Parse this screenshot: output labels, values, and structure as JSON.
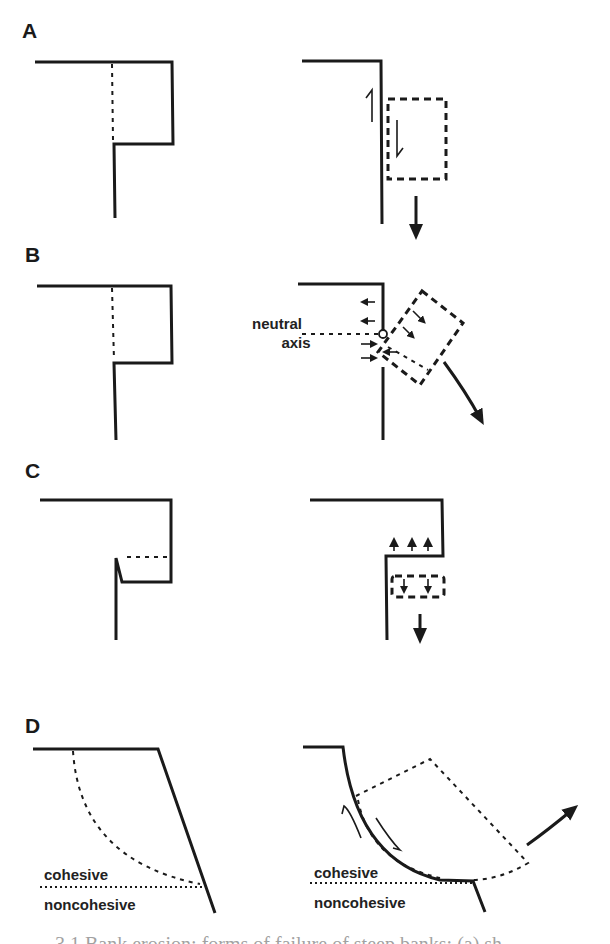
{
  "figure": {
    "panels": [
      {
        "id": "A",
        "label": "A",
        "mechanism": "shear failure"
      },
      {
        "id": "B",
        "label": "B",
        "mechanism": "beam / tensile failure",
        "annotation": "neutral axis",
        "annotation_line1": "neutral",
        "annotation_line2": "axis"
      },
      {
        "id": "C",
        "label": "C",
        "mechanism": "tensile failure"
      },
      {
        "id": "D",
        "label": "D",
        "mechanism": "rotational slip",
        "layer_upper": "cohesive",
        "layer_lower": "noncohesive"
      }
    ],
    "caption_truncated": "...3.1 Bank erosion: forms of failure of steep banks: (a) sh..."
  },
  "colors": {
    "ink": "#1a1a1a",
    "background": "#ffffff"
  }
}
